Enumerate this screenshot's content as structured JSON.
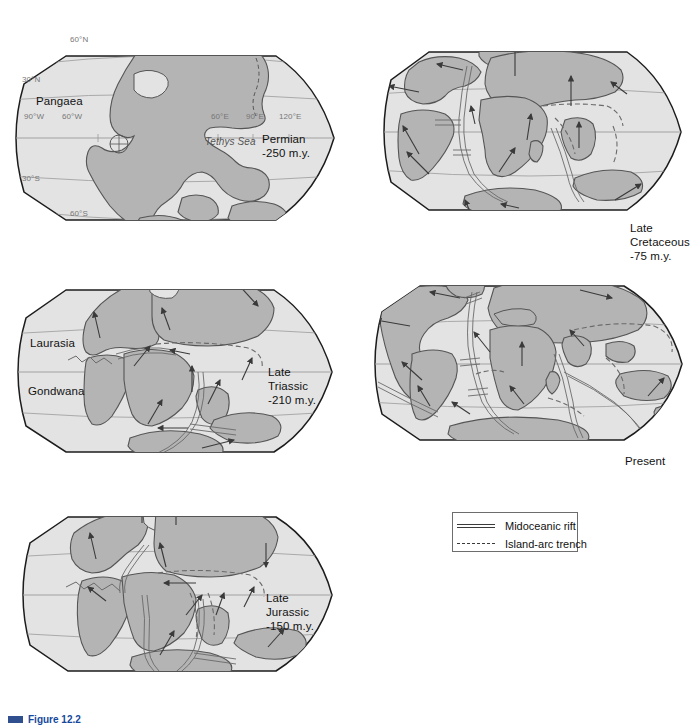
{
  "figure": {
    "caption_marker": "figure-bar",
    "caption_text": "Figure 12.2"
  },
  "maps": [
    {
      "id": "permian",
      "name": "Permian world map",
      "region_labels": [
        "Pangaea",
        "Tethys Sea"
      ],
      "era_name": "Permian",
      "era_age": "-250 m.y.",
      "grid_labels": [
        "60°N",
        "30°N",
        "90°W",
        "60°W",
        "60°E",
        "90°E",
        "120°E",
        "30°S",
        "60°S"
      ]
    },
    {
      "id": "late-triassic",
      "name": "Late Triassic world map",
      "region_labels": [
        "Laurasia",
        "Gondwana"
      ],
      "era_name": "Late\nTriassic",
      "era_age": "-210 m.y.",
      "grid_labels": []
    },
    {
      "id": "late-jurassic",
      "name": "Late Jurassic world map",
      "region_labels": [],
      "era_name": "Late\nJurassic",
      "era_age": "-150 m.y.",
      "grid_labels": []
    },
    {
      "id": "late-cretaceous",
      "name": "Late Cretaceous world map",
      "region_labels": [],
      "era_name": "Late\nCretaceous",
      "era_age": "-75 m.y.",
      "grid_labels": []
    },
    {
      "id": "present",
      "name": "Present day world map",
      "region_labels": [],
      "era_name": "Present",
      "era_age": "",
      "grid_labels": []
    }
  ],
  "legend": {
    "title": "",
    "items": [
      {
        "symbol": "double-solid-line",
        "label": "Midoceanic rift"
      },
      {
        "symbol": "dashed-line",
        "label": "Island-arc trench"
      }
    ]
  },
  "colors": {
    "land": "#b4b4b4",
    "ocean": "#e3e3e3",
    "outline": "#1c1c1c",
    "coast": "#555555",
    "graticule": "#9a9a9a",
    "arrow": "#3a3a3a",
    "caption": "#15489c",
    "background": "#ffffff"
  }
}
